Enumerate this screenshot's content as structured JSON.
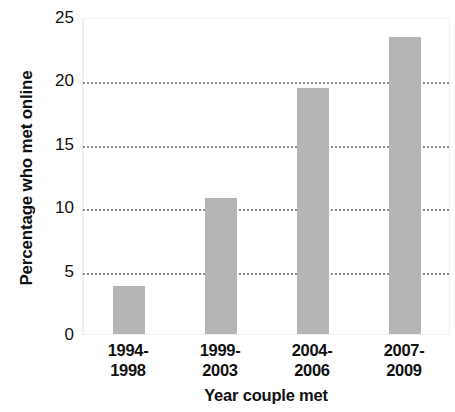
{
  "chart_data": {
    "type": "bar",
    "title": "",
    "subtitle": "",
    "xlabel": "Year couple met",
    "ylabel": "Percentage who met online",
    "categories": [
      "1994–1998",
      "1999–2003",
      "2004–2006",
      "2007–2009"
    ],
    "category_lines": [
      [
        "1994-",
        "1998"
      ],
      [
        "1999-",
        "2003"
      ],
      [
        "2004-",
        "2006"
      ],
      [
        "2007-",
        "2009"
      ]
    ],
    "values": [
      3.8,
      10.7,
      19.4,
      23.4
    ],
    "ylim": [
      0,
      25
    ],
    "yticks": [
      0,
      5,
      10,
      15,
      20,
      25
    ],
    "ytick_labels": [
      "0",
      "5",
      "10",
      "15",
      "20",
      "25"
    ],
    "gridlines": [
      5,
      10,
      15,
      20
    ],
    "grid": true,
    "grid_style": "dotted",
    "legend": null,
    "legend_position": "none",
    "annotations": [],
    "colors": {
      "bar": "#b5b5b5",
      "grid": "#8c8c8c",
      "text": "#111111",
      "background": "#ffffff",
      "plot_border": "#f1f1f1"
    }
  }
}
